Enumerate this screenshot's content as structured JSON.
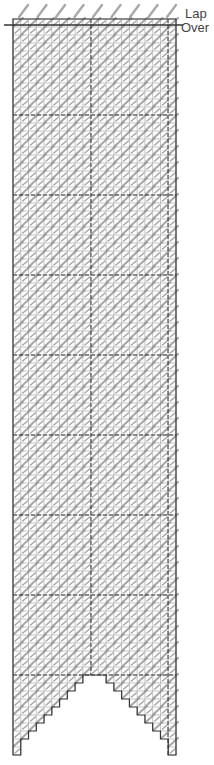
{
  "diagram": {
    "labels": {
      "lap": "Lap",
      "over": "Over"
    },
    "grid": {
      "left": 13,
      "right": 176,
      "top": 19,
      "bottom": 755,
      "columns": 21,
      "cell_height": 8,
      "lap_over_line_y": 25,
      "section_rows": 10,
      "center_dash_x": 91,
      "right_dash_x": 168
    },
    "colors": {
      "grid_line": "#888888",
      "border": "#333333",
      "stitch": "#a8a8a8",
      "dash": "#333333",
      "text": "#444444"
    },
    "notch": {
      "apex_y": 675,
      "apex_x": 94,
      "steps": 10
    }
  }
}
